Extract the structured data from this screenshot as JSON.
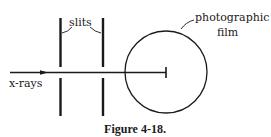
{
  "figure": {
    "caption": "Figure 4-18.",
    "labels": {
      "slits": "slits",
      "film_line1": "photographic",
      "film_line2": "film",
      "xrays": "x-rays"
    },
    "colors": {
      "ink": "#1a1a1a",
      "background": "#ffffff"
    }
  }
}
